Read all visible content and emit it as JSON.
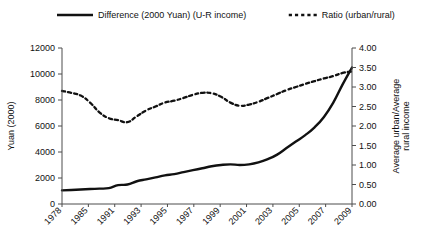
{
  "chart_data": {
    "type": "line",
    "title": "",
    "xlabel": "",
    "ylabel": "Yuan (2000)",
    "y2label": "Average urban/Average rural income",
    "grid": false,
    "legend_position": "top",
    "ylim": [
      0,
      12000
    ],
    "y2lim": [
      0,
      4.0
    ],
    "ytick_labels": [
      "12000",
      "10000",
      "8000",
      "6000",
      "4000",
      "2000",
      "0"
    ],
    "ytick_values": [
      12000,
      10000,
      8000,
      6000,
      4000,
      2000,
      0
    ],
    "y2tick_labels": [
      "4.00",
      "3.50",
      "3.00",
      "2.50",
      "2.00",
      "1.50",
      "1.00",
      "0.50",
      "0.00"
    ],
    "y2tick_values": [
      4.0,
      3.5,
      3.0,
      2.5,
      2.0,
      1.5,
      1.0,
      0.5,
      0.0
    ],
    "xtick_labels": [
      "1978",
      "1985",
      "1991",
      "1993",
      "1995",
      "1997",
      "1999",
      "2001",
      "2003",
      "2005",
      "2007",
      "2009"
    ],
    "x": [
      1978,
      1979,
      1980,
      1981,
      1982,
      1983,
      1984,
      1985,
      1986,
      1987,
      1988,
      1989,
      1990,
      1991,
      1992,
      1993,
      1994,
      1995,
      1996,
      1997,
      1998,
      1999,
      2000,
      2001,
      2002,
      2003,
      2004,
      2005,
      2006,
      2007,
      2008,
      2009
    ],
    "series": [
      {
        "name": "Difference (2000 Yuan) (U-R income)",
        "axis": "left",
        "style": "solid",
        "color": "#111111",
        "values": [
          1050,
          1080,
          1120,
          1150,
          1180,
          1220,
          1450,
          1500,
          1750,
          1900,
          2050,
          2200,
          2300,
          2450,
          2600,
          2750,
          2900,
          3000,
          3050,
          3000,
          3050,
          3200,
          3450,
          3800,
          4300,
          4800,
          5300,
          5900,
          6700,
          7800,
          9200,
          10500
        ]
      },
      {
        "name": "Ratio (urban/rural)",
        "axis": "right",
        "style": "dashed",
        "color": "#111111",
        "values": [
          2.9,
          2.85,
          2.78,
          2.6,
          2.35,
          2.2,
          2.15,
          2.1,
          2.25,
          2.4,
          2.5,
          2.6,
          2.65,
          2.72,
          2.8,
          2.85,
          2.84,
          2.75,
          2.6,
          2.52,
          2.55,
          2.62,
          2.72,
          2.82,
          2.92,
          3.0,
          3.08,
          3.15,
          3.22,
          3.28,
          3.36,
          3.4
        ]
      }
    ],
    "legend": [
      {
        "label": "Difference (2000 Yuan) (U-R income)",
        "style": "solid"
      },
      {
        "label": "Ratio (urban/rural)",
        "style": "dashed"
      }
    ]
  }
}
